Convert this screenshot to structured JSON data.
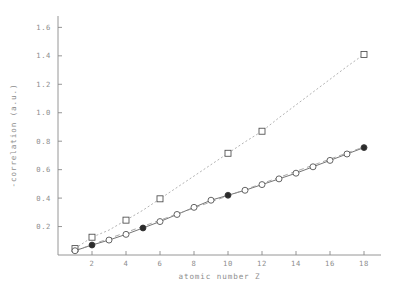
{
  "chart_data": {
    "type": "line",
    "title": "",
    "xlabel": "atomic number Z",
    "ylabel": "-correlation (a.u.)",
    "xlim": [
      0,
      19
    ],
    "ylim": [
      0,
      1.68
    ],
    "xticks": [
      2,
      4,
      6,
      8,
      10,
      12,
      14,
      16,
      18
    ],
    "xtick_labels": [
      "2",
      "4",
      "6",
      "8",
      "10",
      "12",
      "14",
      "16",
      "18"
    ],
    "yticks": [
      0.2,
      0.4,
      0.6,
      0.8,
      1.0,
      1.2,
      1.4,
      1.6
    ],
    "ytick_labels": [
      "0.2",
      "0.4",
      "0.6",
      "0.8",
      "1.0",
      "1.2",
      "1.4",
      "1.6"
    ],
    "grid": false,
    "legend": "none",
    "series": [
      {
        "name": "dotted-upper-series",
        "style": "dotted",
        "marker": "square",
        "x": [
          1,
          2,
          3,
          4,
          5,
          6,
          7,
          8,
          9,
          10,
          11,
          12,
          13,
          14,
          15,
          16,
          17,
          18
        ],
        "y": [
          0.045,
          0.125,
          0.175,
          0.245,
          0.315,
          0.395,
          0.475,
          0.555,
          0.635,
          0.715,
          0.795,
          0.87,
          0.965,
          1.055,
          1.145,
          1.235,
          1.325,
          1.41
        ],
        "marker_x": [
          1,
          2,
          4,
          6,
          10,
          12,
          18
        ],
        "marker_y": [
          0.045,
          0.125,
          0.245,
          0.395,
          0.715,
          0.87,
          1.41
        ]
      },
      {
        "name": "solid-lower-series",
        "style": "solid",
        "marker": "circle",
        "x": [
          1,
          2,
          3,
          4,
          5,
          6,
          7,
          8,
          9,
          10,
          11,
          12,
          13,
          14,
          15,
          16,
          17,
          18
        ],
        "y": [
          0.03,
          0.07,
          0.105,
          0.145,
          0.19,
          0.235,
          0.285,
          0.335,
          0.385,
          0.42,
          0.455,
          0.495,
          0.535,
          0.575,
          0.62,
          0.665,
          0.71,
          0.755
        ]
      },
      {
        "name": "dashed-reference-series",
        "style": "dashed",
        "marker": "none",
        "x": [
          1,
          18
        ],
        "y": [
          0.03,
          0.76
        ]
      }
    ],
    "highlight_points": [
      {
        "x": 2,
        "y": 0.07,
        "marker": "filled"
      },
      {
        "x": 5,
        "y": 0.19,
        "marker": "filled"
      },
      {
        "x": 10,
        "y": 0.42,
        "marker": "filled"
      },
      {
        "x": 18,
        "y": 0.755,
        "marker": "filled"
      }
    ]
  }
}
